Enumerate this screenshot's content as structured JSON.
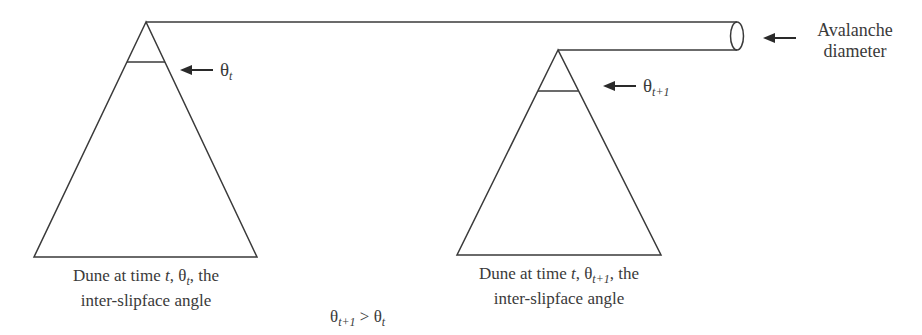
{
  "diagram": {
    "title": "",
    "left_dune": {
      "angle_label": "θ",
      "angle_sub": "t",
      "caption_line1_prefix": "Dune at time ",
      "caption_line1_t": "t",
      "caption_line1_theta": ", θ",
      "caption_line1_sub": "t",
      "caption_line1_suffix": ", the",
      "caption_line2": "inter-slipface angle"
    },
    "right_dune": {
      "angle_label": "θ",
      "angle_sub": "t+1",
      "caption_line1_prefix": "Dune at time ",
      "caption_line1_t": "t",
      "caption_line1_theta": ", θ",
      "caption_line1_sub": "t+1",
      "caption_line1_suffix": ", the",
      "caption_line2": "inter-slipface angle"
    },
    "avalanche": {
      "line1": "Avalanche",
      "line2": "diameter"
    },
    "relation": {
      "lhs": "θ",
      "lhs_sub": "t+1",
      "op": " > ",
      "rhs": "θ",
      "rhs_sub": "t"
    },
    "colors": {
      "stroke": "#3a3a3a",
      "background": "#ffffff"
    }
  }
}
